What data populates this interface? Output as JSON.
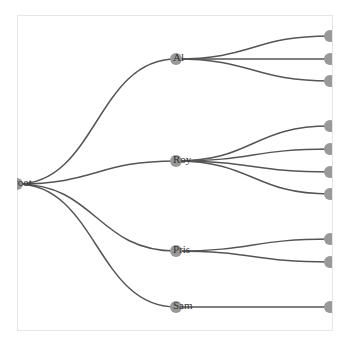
{
  "diagram": {
    "type": "tree",
    "orientation": "left-to-right",
    "colors": {
      "link": "#555555",
      "node": "#999999",
      "frame": "#e6e6e6",
      "label": "#333333"
    },
    "frame": {
      "x": 17,
      "y": 15,
      "width": 315,
      "height": 315
    },
    "root": {
      "id": "root",
      "label": "root",
      "x": 17,
      "y": 184
    },
    "children": [
      {
        "id": "al",
        "label": "Al",
        "x": 176,
        "y": 59,
        "leaves": [
          {
            "x": 330,
            "y": 36
          },
          {
            "x": 330,
            "y": 59
          },
          {
            "x": 330,
            "y": 81
          }
        ]
      },
      {
        "id": "roy",
        "label": "Roy",
        "x": 176,
        "y": 161,
        "leaves": [
          {
            "x": 330,
            "y": 126
          },
          {
            "x": 330,
            "y": 149
          },
          {
            "x": 330,
            "y": 172
          },
          {
            "x": 330,
            "y": 194
          }
        ]
      },
      {
        "id": "pris",
        "label": "Pris",
        "x": 176,
        "y": 251,
        "leaves": [
          {
            "x": 330,
            "y": 239
          },
          {
            "x": 330,
            "y": 262
          }
        ]
      },
      {
        "id": "sam",
        "label": "Sam",
        "x": 176,
        "y": 307,
        "leaves": [
          {
            "x": 330,
            "y": 307
          }
        ]
      }
    ]
  }
}
